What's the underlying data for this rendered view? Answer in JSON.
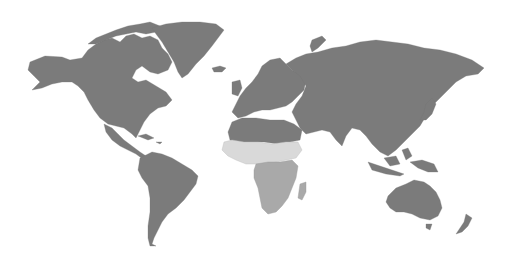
{
  "map": {
    "type": "world-choropleth",
    "background": "#ffffff",
    "legend": null,
    "categories": [
      {
        "id": "dark",
        "color": "#7b7b7b",
        "regions": [
          "North America",
          "Greenland",
          "Central America",
          "Caribbean",
          "South America",
          "Europe",
          "North Africa",
          "Middle East",
          "Russia",
          "Central Asia",
          "South Asia",
          "East Asia",
          "Southeast Asia",
          "Australia",
          "New Zealand",
          "Pacific Islands"
        ]
      },
      {
        "id": "light",
        "color": "#d9d9d9",
        "regions": [
          "West Africa",
          "Sahel",
          "Horn of Africa"
        ]
      },
      {
        "id": "mid",
        "color": "#a9a9a9",
        "regions": [
          "Central Africa",
          "East Africa",
          "Southern Africa",
          "Madagascar"
        ]
      }
    ]
  }
}
